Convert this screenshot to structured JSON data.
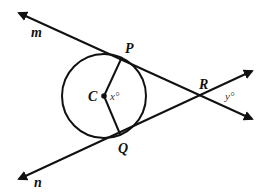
{
  "diagram": {
    "type": "geometry",
    "colors": {
      "stroke": "#111111",
      "background": "#ffffff"
    },
    "labels": {
      "line_m": "m",
      "line_n": "n",
      "point_p": "P",
      "point_q": "Q",
      "point_r": "R",
      "center_c": "C",
      "angle_x": "x°",
      "angle_y": "y°"
    },
    "circle": {
      "center": [
        104,
        96
      ],
      "radius": 42
    },
    "points": {
      "C": [
        104,
        96
      ],
      "P": [
        122,
        57
      ],
      "Q": [
        120,
        134
      ],
      "R": [
        202,
        93
      ]
    },
    "lines": {
      "m": {
        "from": [
          19,
          13
        ],
        "to": [
          252,
          119
        ],
        "arrows": "both"
      },
      "n": {
        "from": [
          19,
          179
        ],
        "to": [
          252,
          71
        ],
        "arrows": "both"
      }
    },
    "segments": [
      {
        "from": "C",
        "to": "P"
      },
      {
        "from": "C",
        "to": "Q"
      }
    ]
  }
}
